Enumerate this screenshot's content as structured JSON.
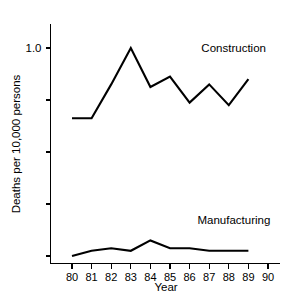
{
  "chart_data": {
    "type": "line",
    "title": "",
    "xlabel": "Year",
    "ylabel": "Deaths per 10,000 persons",
    "x": [
      80,
      81,
      82,
      83,
      84,
      85,
      86,
      87,
      88,
      89
    ],
    "categories": [
      "80",
      "81",
      "82",
      "83",
      "84",
      "85",
      "86",
      "87",
      "88",
      "89"
    ],
    "xtick_labels": [
      "80",
      "81",
      "82",
      "83",
      "84",
      "85",
      "86",
      "87",
      "88",
      "89",
      "90"
    ],
    "ytick_labels": [
      "1.0",
      "",
      "",
      "",
      ""
    ],
    "ytick_values": [
      1.0,
      0.8,
      0.6,
      0.4,
      0.2
    ],
    "xlim": [
      79.5,
      90.5
    ],
    "ylim": [
      0.1,
      1.08
    ],
    "grid": false,
    "legend_position": "inline-right",
    "series": [
      {
        "name": "Construction",
        "values": [
          0.73,
          0.73,
          0.86,
          1.0,
          0.85,
          0.89,
          0.79,
          0.86,
          0.78,
          0.88
        ]
      },
      {
        "name": "Manufacturing",
        "values": [
          0.2,
          0.22,
          0.23,
          0.22,
          0.26,
          0.23,
          0.23,
          0.22,
          0.22,
          0.22
        ]
      }
    ],
    "annotations": [
      {
        "text": "Construction",
        "x": 86.6,
        "y": 0.985
      },
      {
        "text": "Manufacturing",
        "x": 86.4,
        "y": 0.325
      }
    ]
  }
}
